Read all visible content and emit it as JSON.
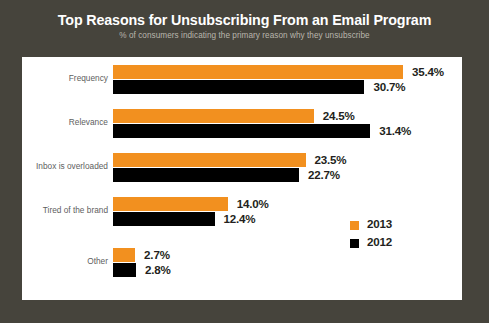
{
  "chart_data": {
    "type": "bar",
    "orientation": "horizontal",
    "title": "Top Reasons for Unsubscribing From an Email Program",
    "subtitle": "% of consumers indicating the primary reason why they unsubscribe",
    "xlabel": "",
    "ylabel": "",
    "grid": false,
    "legend_position": "middle-right",
    "xlim": [
      0,
      35.4
    ],
    "categories": [
      "Frequency",
      "Relevance",
      "Inbox is overloaded",
      "Tired of the brand",
      "Other"
    ],
    "series": [
      {
        "name": "2013",
        "color": "#f2901f",
        "values": [
          35.4,
          24.5,
          23.5,
          14.0,
          2.7
        ],
        "labels": [
          "35.4%",
          "24.5%",
          "23.5%",
          "14.0%",
          "2.7%"
        ]
      },
      {
        "name": "2012",
        "color": "#000000",
        "values": [
          30.7,
          31.4,
          22.7,
          12.4,
          2.8
        ],
        "labels": [
          "30.7%",
          "31.4%",
          "22.7%",
          "12.4%",
          "2.8%"
        ]
      }
    ]
  },
  "legend": {
    "items": [
      {
        "label": "2013",
        "color": "#f2901f"
      },
      {
        "label": "2012",
        "color": "#000000"
      }
    ]
  },
  "theme": {
    "frame_color": "#46443c",
    "panel_color": "#ffffff",
    "title_color": "#ffffff",
    "subtitle_color": "#b9b6ac",
    "category_label_color": "#5e5e5e",
    "value_label_color": "#231f20",
    "accent_2013": "#f2901f",
    "accent_2012": "#000000"
  }
}
